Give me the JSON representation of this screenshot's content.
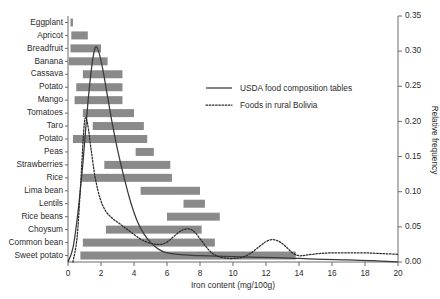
{
  "chart_data": {
    "type": "bar",
    "title": "",
    "xlabel": "Iron content (mg/100g)",
    "ylabel": "Relative frequency",
    "xlim": [
      0,
      20
    ],
    "ylim": [
      0,
      0.35
    ],
    "grid": false,
    "orientation": "horizontal",
    "xticks": [
      "0",
      "2",
      "4",
      "6",
      "8",
      "10",
      "12",
      "14",
      "16",
      "18",
      "20"
    ],
    "xtick_values": [
      0,
      2,
      4,
      6,
      8,
      10,
      12,
      14,
      16,
      18,
      20
    ],
    "yticks": [
      "0.00",
      "0.05",
      "0.10",
      "0.15",
      "0.20",
      "0.25",
      "0.30",
      "0.35"
    ],
    "ytick_values": [
      0.0,
      0.05,
      0.1,
      0.15,
      0.2,
      0.25,
      0.3,
      0.35
    ],
    "categories": [
      "Eggplant",
      "Apricot",
      "Breadfruit",
      "Banana",
      "Cassava",
      "Potato",
      "Mango",
      "Tomatoes",
      "Taro",
      "Potato",
      "Peas",
      "Strawberries",
      "Rice",
      "Lima bean",
      "Lentils",
      "Rice beans",
      "Choysum",
      "Common bean",
      "Sweet potato"
    ],
    "ranges": [
      {
        "category": "Eggplant",
        "start": 0.15,
        "end": 0.3
      },
      {
        "category": "Apricot",
        "start": 0.2,
        "end": 1.2
      },
      {
        "category": "Breadfruit",
        "start": 0.15,
        "end": 2.0
      },
      {
        "category": "Banana",
        "start": 0.05,
        "end": 2.4
      },
      {
        "category": "Cassava",
        "start": 0.9,
        "end": 3.3
      },
      {
        "category": "Potato",
        "start": 0.5,
        "end": 3.3
      },
      {
        "category": "Mango",
        "start": 0.4,
        "end": 3.3
      },
      {
        "category": "Tomatoes",
        "start": 0.9,
        "end": 4.0
      },
      {
        "category": "Taro",
        "start": 1.5,
        "end": 4.6
      },
      {
        "category": "Potato",
        "start": 0.3,
        "end": 4.8
      },
      {
        "category": "Peas",
        "start": 4.1,
        "end": 5.2
      },
      {
        "category": "Strawberries",
        "start": 2.2,
        "end": 6.2
      },
      {
        "category": "Rice",
        "start": 0.85,
        "end": 6.3
      },
      {
        "category": "Lima bean",
        "start": 4.4,
        "end": 8.0
      },
      {
        "category": "Lentils",
        "start": 7.0,
        "end": 8.3
      },
      {
        "category": "Rice beans",
        "start": 6.0,
        "end": 9.2
      },
      {
        "category": "Choysum",
        "start": 2.3,
        "end": 8.1
      },
      {
        "category": "Common bean",
        "start": 0.9,
        "end": 8.9
      },
      {
        "category": "Sweet potato",
        "start": 0.75,
        "end": 13.8
      }
    ],
    "series": [
      {
        "name": "USDA food composition tables",
        "style": "solid",
        "points": [
          [
            0.0,
            0.0
          ],
          [
            0.3,
            0.02
          ],
          [
            0.6,
            0.07
          ],
          [
            0.9,
            0.14
          ],
          [
            1.2,
            0.225
          ],
          [
            1.45,
            0.28
          ],
          [
            1.65,
            0.305
          ],
          [
            1.85,
            0.3
          ],
          [
            2.1,
            0.275
          ],
          [
            2.4,
            0.235
          ],
          [
            2.7,
            0.195
          ],
          [
            3.0,
            0.16
          ],
          [
            3.4,
            0.12
          ],
          [
            3.8,
            0.085
          ],
          [
            4.2,
            0.058
          ],
          [
            4.6,
            0.04
          ],
          [
            5.0,
            0.028
          ],
          [
            5.5,
            0.018
          ],
          [
            6.0,
            0.013
          ],
          [
            7.0,
            0.01
          ],
          [
            8.0,
            0.009
          ],
          [
            9.5,
            0.008
          ],
          [
            11.0,
            0.007
          ],
          [
            13.0,
            0.006
          ],
          [
            15.0,
            0.004
          ],
          [
            17.0,
            0.003
          ],
          [
            18.5,
            0.002
          ],
          [
            20.0,
            0.0
          ]
        ]
      },
      {
        "name": "Foods in rural Bolivia",
        "style": "dotted",
        "points": [
          [
            0.3,
            0.0
          ],
          [
            0.55,
            0.035
          ],
          [
            0.75,
            0.105
          ],
          [
            0.95,
            0.185
          ],
          [
            1.05,
            0.205
          ],
          [
            1.2,
            0.195
          ],
          [
            1.4,
            0.16
          ],
          [
            1.65,
            0.12
          ],
          [
            1.95,
            0.09
          ],
          [
            2.3,
            0.072
          ],
          [
            2.7,
            0.062
          ],
          [
            3.1,
            0.055
          ],
          [
            3.5,
            0.048
          ],
          [
            3.9,
            0.041
          ],
          [
            4.3,
            0.034
          ],
          [
            4.7,
            0.029
          ],
          [
            5.1,
            0.026
          ],
          [
            5.5,
            0.025
          ],
          [
            5.9,
            0.027
          ],
          [
            6.3,
            0.034
          ],
          [
            6.7,
            0.042
          ],
          [
            7.0,
            0.046
          ],
          [
            7.35,
            0.047
          ],
          [
            7.7,
            0.042
          ],
          [
            8.1,
            0.03
          ],
          [
            8.5,
            0.018
          ],
          [
            8.9,
            0.01
          ],
          [
            9.4,
            0.006
          ],
          [
            10.0,
            0.005
          ],
          [
            10.6,
            0.007
          ],
          [
            11.1,
            0.013
          ],
          [
            11.6,
            0.022
          ],
          [
            12.0,
            0.029
          ],
          [
            12.4,
            0.032
          ],
          [
            12.8,
            0.029
          ],
          [
            13.2,
            0.022
          ],
          [
            13.6,
            0.013
          ],
          [
            14.0,
            0.009
          ],
          [
            14.5,
            0.01
          ],
          [
            15.2,
            0.012
          ],
          [
            16.0,
            0.013
          ],
          [
            17.0,
            0.013
          ],
          [
            18.0,
            0.013
          ],
          [
            19.0,
            0.012
          ],
          [
            20.0,
            0.011
          ]
        ]
      }
    ],
    "legend": {
      "position": "upper-right-inside",
      "entries": [
        {
          "label": "USDA food composition tables",
          "style": "solid"
        },
        {
          "label": "Foods in rural Bolivia",
          "style": "dotted"
        }
      ]
    }
  }
}
